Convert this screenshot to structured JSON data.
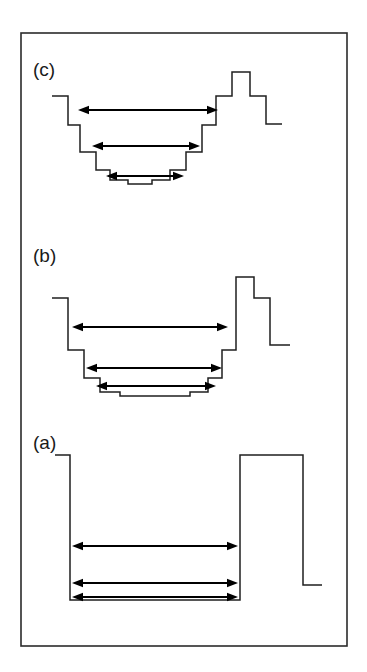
{
  "figure": {
    "background_color": "#ffffff",
    "line_color": "#1f1f1f",
    "frame_color": "#2b2b2b",
    "arrow_color": "#000000",
    "frame": {
      "x": 21,
      "y": 33,
      "width": 326,
      "height": 613
    }
  },
  "panels": [
    {
      "id": "panel-c",
      "label": "(c)",
      "label_x": 33,
      "label_y": 76,
      "description": "Finely stepped (near-parabolic) quantum well with a stepped double barrier on the right",
      "profile_points": "52,96 68,96 68,125 80,125 80,152 96,152 96,170 110,170 110,180 128,180 128,184 152,184 152,180 170,180 170,170 186,170 186,152 202,152 202,125 216,125 216,96 232,96 232,72 250,72 250,96 266,96 266,124 282,124",
      "arrows": [
        {
          "name": "transition-arrow-1",
          "y": 110,
          "x1": 78,
          "x2": 218
        },
        {
          "name": "transition-arrow-2",
          "y": 146,
          "x1": 92,
          "x2": 200
        },
        {
          "name": "transition-arrow-3",
          "y": 176,
          "x1": 106,
          "x2": 184
        }
      ]
    },
    {
      "id": "panel-b",
      "label": "(b)",
      "label_x": 33,
      "label_y": 262,
      "description": "Coarsely stepped quantum well with a stepped double barrier on the right",
      "profile_points": "52,298 68,298 68,350 84,350 84,378 100,378 100,392 120,392 120,396 190,396 190,392 208,392 208,378 222,378 222,350 236,350 236,277 254,277 254,298 270,298 270,345 290,345",
      "arrows": [
        {
          "name": "transition-arrow-1",
          "y": 327,
          "x1": 72,
          "x2": 228
        },
        {
          "name": "transition-arrow-2",
          "y": 368,
          "x1": 86,
          "x2": 222
        },
        {
          "name": "transition-arrow-3",
          "y": 386,
          "x1": 96,
          "x2": 216
        }
      ]
    },
    {
      "id": "panel-a",
      "label": "(a)",
      "label_x": 33,
      "label_y": 449,
      "description": "Square quantum well with a rectangular barrier on the right",
      "profile_points": "55,455 70,455 70,600 240,600 240,455 303,455 303,585 322,585",
      "arrows": [
        {
          "name": "transition-arrow-1",
          "y": 546,
          "x1": 72,
          "x2": 238
        },
        {
          "name": "transition-arrow-2",
          "y": 583,
          "x1": 72,
          "x2": 238
        },
        {
          "name": "transition-arrow-3",
          "y": 597,
          "x1": 72,
          "x2": 238
        }
      ]
    }
  ]
}
